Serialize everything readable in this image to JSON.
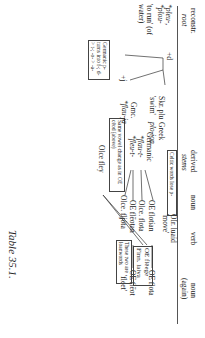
{
  "header": {
    "col1": "reconstr.",
    "col1_sub": "root",
    "col2": "derived",
    "col2_sub": "stems",
    "col3": "noun",
    "col4": "verb",
    "col5": "noun",
    "col5_sub": "(again)"
  },
  "root": {
    "forms": "*pleu-, *plou-",
    "gloss": "'to run' (of water)",
    "suffix_d": "+d",
    "suffix_j": "+j"
  },
  "boxes": {
    "germanic_rule": "Germanic p- turns into f-; d- > t-; -o- > -a-",
    "celtic": "Celtic words lose p-",
    "vowel_change": "Same vowel change as in OE cēod (above)",
    "loanwords": "These two are loanwords"
  },
  "rows": {
    "celtic_verb": "OIr. luaid 'move'",
    "germanic_label": "Germanic",
    "stem1": "*flau-t-",
    "stem2": "*fleu-t-",
    "oe_flotian": "OE flotian",
    "oe_flota": "OE flota",
    "olce_flota": "Olce. flota",
    "oe_fleotan": "OE flēotan",
    "oe_fleot": "OE flēot",
    "olce_fljota": "Olce. fljóta",
    "fleet": "'fleet'",
    "gmc_label": "Gmc.",
    "gmc_form": "*flau-ja",
    "olce_fley": "Olce fley",
    "oe_fleege": "OE flēege",
    "finn_laiva": "Finn. laiva",
    "skr": "Skr. plu",
    "skr_gloss": "'swim'",
    "greek": "Greek",
    "greek_form": "plo-ion"
  },
  "caption": "Table 35.1."
}
